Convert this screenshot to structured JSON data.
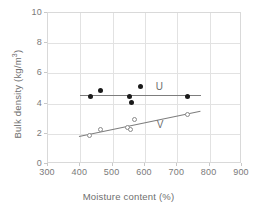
{
  "chart_data": {
    "type": "scatter",
    "title": "",
    "xlabel": "Moisture content (%)",
    "ylabel": "Bulk density (kg/m3)",
    "ylabel_display": "Bulk density (kg/m",
    "ylabel_sup": "3",
    "ylabel_tail": ")",
    "xlim": [
      300,
      900
    ],
    "ylim": [
      0,
      10
    ],
    "xticks": [
      300,
      400,
      500,
      600,
      700,
      800,
      900
    ],
    "yticks": [
      0,
      2,
      4,
      6,
      8,
      10
    ],
    "grid": true,
    "legend_position": "inside-plot",
    "axis_color": "#d9d9d9",
    "grid_color": "#e2e2e2",
    "marker_fill_color": "#1a1a1a",
    "marker_open_color": "#8a8a8a",
    "trendline_color": "#7d7d7d",
    "series": [
      {
        "name": "U",
        "marker": "filled-circle",
        "label": "U",
        "label_x": 645,
        "label_y": 5.15,
        "points": [
          {
            "x": 432,
            "y": 4.48
          },
          {
            "x": 462,
            "y": 4.88
          },
          {
            "x": 551,
            "y": 4.45
          },
          {
            "x": 558,
            "y": 4.07
          },
          {
            "x": 585,
            "y": 5.15
          },
          {
            "x": 731,
            "y": 4.47
          }
        ],
        "trendline": {
          "x1": 398,
          "y1": 4.6,
          "x2": 772,
          "y2": 4.6
        }
      },
      {
        "name": "V",
        "marker": "open-circle",
        "label": "V",
        "label_x": 647,
        "label_y": 2.62,
        "points": [
          {
            "x": 428,
            "y": 1.89
          },
          {
            "x": 462,
            "y": 2.26
          },
          {
            "x": 546,
            "y": 2.42
          },
          {
            "x": 556,
            "y": 2.27
          },
          {
            "x": 566,
            "y": 2.96
          },
          {
            "x": 732,
            "y": 3.3
          }
        ],
        "trendline": {
          "x1": 396,
          "y1": 1.85,
          "x2": 772,
          "y2": 3.52
        }
      }
    ]
  },
  "axes": {
    "x_tick_labels": [
      "300",
      "400",
      "500",
      "600",
      "700",
      "800",
      "900"
    ],
    "y_tick_labels": [
      "0",
      "2",
      "4",
      "6",
      "8",
      "10"
    ],
    "x_title": "Moisture content (%)"
  }
}
